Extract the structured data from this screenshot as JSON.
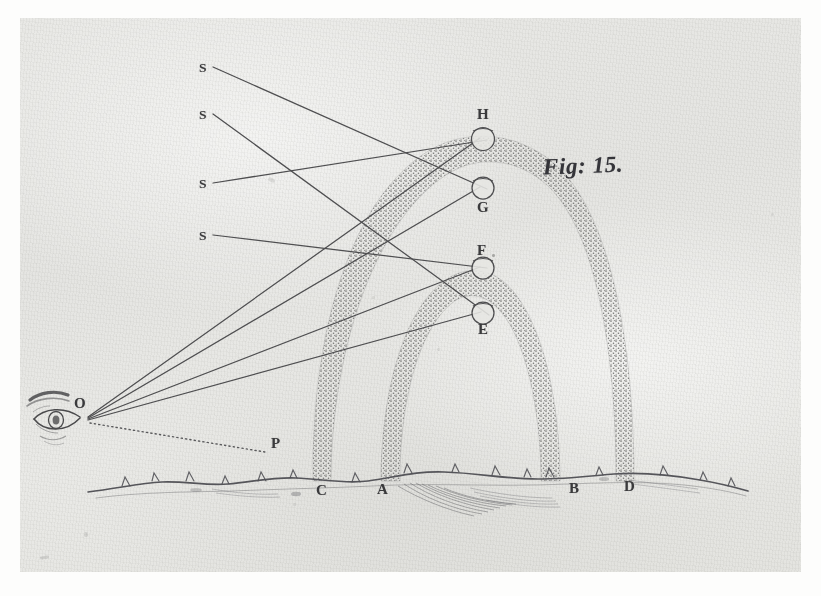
{
  "figure": {
    "caption": "Fig: 15.",
    "medium": "engraved-plate-on-aged-paper"
  },
  "colors": {
    "paper": "#e7e7e4",
    "scan_margin": "#fdfdfc",
    "ink": "#4a4a4c",
    "ink_dark": "#3a3a3c",
    "stipple": "#6f6f6d"
  },
  "labels": {
    "sun_rays": [
      {
        "name": "S",
        "text": "S",
        "x": 200,
        "y": 61
      },
      {
        "name": "S",
        "text": "S",
        "x": 200,
        "y": 108
      },
      {
        "name": "S",
        "text": "S",
        "x": 200,
        "y": 177
      },
      {
        "name": "S",
        "text": "S",
        "x": 200,
        "y": 229
      }
    ],
    "eye": {
      "text": "O",
      "x": 75,
      "y": 404
    },
    "horizon_point": {
      "text": "P",
      "x": 272,
      "y": 443
    },
    "drops": [
      {
        "text": "H",
        "x": 478,
        "y": 112,
        "position": "above"
      },
      {
        "text": "G",
        "x": 478,
        "y": 205,
        "position": "below"
      },
      {
        "text": "F",
        "x": 478,
        "y": 248,
        "position": "above"
      },
      {
        "text": "E",
        "x": 479,
        "y": 327,
        "position": "below"
      }
    ],
    "ground_points": [
      {
        "text": "C",
        "x": 317,
        "y": 489
      },
      {
        "text": "A",
        "x": 378,
        "y": 488
      },
      {
        "text": "B",
        "x": 570,
        "y": 487
      },
      {
        "text": "D",
        "x": 625,
        "y": 485
      }
    ]
  },
  "geometry": {
    "eye_point": {
      "x": 86,
      "y": 418
    },
    "horizon_dotted_end": {
      "x": 265,
      "y": 452
    },
    "sun_ray_starts": [
      {
        "x": 213,
        "y": 67
      },
      {
        "x": 213,
        "y": 114
      },
      {
        "x": 213,
        "y": 183
      },
      {
        "x": 213,
        "y": 235
      }
    ],
    "drop_points": [
      {
        "id": "H",
        "x": 484,
        "y": 139
      },
      {
        "id": "G",
        "x": 484,
        "y": 188
      },
      {
        "id": "F",
        "x": 484,
        "y": 268
      },
      {
        "id": "E",
        "x": 484,
        "y": 313
      }
    ],
    "sun_to_drop_map": [
      "G",
      "E",
      "H",
      "F"
    ],
    "outer_arc": {
      "name": "secondary-bow",
      "left_foot_x": 321,
      "right_foot_x": 626,
      "ground_y": 480,
      "apex_y": 140,
      "band_width": 18
    },
    "inner_arc": {
      "name": "primary-bow",
      "left_foot_x": 389,
      "right_foot_x": 562,
      "ground_y": 480,
      "apex_y": 270,
      "band_width": 20
    }
  },
  "notes": {
    "description": "Two concentric stippled rainbow arcs rising from an irregular grassy ground line; an eye at O on the left sends four visual rays to raindrops E, F, G, H; four parallel solar rays marked S arrive from the upper left; a dotted line runs from O to P."
  }
}
